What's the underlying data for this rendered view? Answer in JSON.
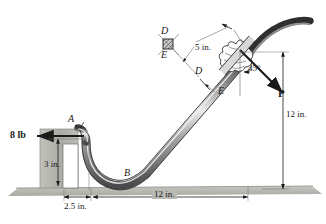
{
  "figure": {
    "type": "engineering-mechanics-free-body-diagram",
    "background_color": "#ffffff",
    "ink_color": "#1a1a1a",
    "bar_fill_light": "#e8e8e8",
    "bar_fill_mid": "#9a9a9a",
    "bar_fill_dark": "#3a3a3a",
    "ground_color": "#b9b9b3",
    "wall_color": "#b0b0ab"
  },
  "labels": {
    "force_left": "8 lb",
    "force_applied": "P",
    "angle": "45°",
    "point_a": "A",
    "point_b": "B",
    "point_d_section": "D",
    "point_e_section": "E",
    "point_d_bar": "D",
    "point_e_bar": "E"
  },
  "dimensions": {
    "height_left": "3 in.",
    "offset_bottom": "2.5 in.",
    "span_bottom": "12 in.",
    "height_right": "12 in.",
    "length_upper": "5 in."
  }
}
